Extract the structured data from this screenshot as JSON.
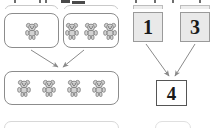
{
  "worksheet": {
    "type": "addition-with-counters",
    "left_group": {
      "name": "bear-counter-model",
      "addend_box_1": {
        "count": 1,
        "icon": "teddy-bear-icon"
      },
      "addend_box_2": {
        "count": 3,
        "icon": "teddy-bear-icon"
      },
      "sum_box": {
        "count": 4,
        "icon": "teddy-bear-icon"
      },
      "arrows": [
        "arrow-down-right",
        "arrow-down-left"
      ]
    },
    "right_group": {
      "name": "numeral-model",
      "addend_1": "1",
      "addend_2": "3",
      "sum": "4",
      "arrows": [
        "arrow-down-right",
        "arrow-down-left"
      ]
    }
  },
  "colors": {
    "page_background": "#ffffff",
    "box_border": "#8c8c8c",
    "tile_fill": "#e9e9e9",
    "tile_border": "#9a9a9a",
    "sum_border": "#555555",
    "arrow_stroke": "#808080",
    "numeral_text": "#1a1a1a",
    "bear_outline": "#7a7a7a",
    "bear_fill": "#d0d0d0",
    "ghost_border": "#c9c9c9"
  },
  "clipped_rows": {
    "top": {
      "label": "previous-problem-row-bottom-edge"
    },
    "bottom": {
      "label": "next-problem-row-top-edge"
    }
  }
}
